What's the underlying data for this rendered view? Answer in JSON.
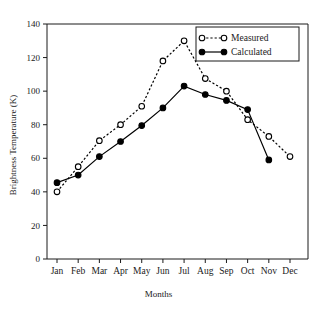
{
  "chart_data": {
    "type": "line",
    "title": "",
    "xlabel": "Months",
    "ylabel": "Brightness Temperature (K)",
    "categories": [
      "Jan",
      "Feb",
      "Mar",
      "Apr",
      "May",
      "Jun",
      "Jul",
      "Aug",
      "Sep",
      "Oct",
      "Nov",
      "Dec"
    ],
    "ylim": [
      0,
      140
    ],
    "yticks": [
      0,
      20,
      40,
      60,
      80,
      100,
      120,
      140
    ],
    "ytick_labels": [
      "0",
      "20",
      "40",
      "60",
      "80",
      "100",
      "120",
      "140"
    ],
    "grid": false,
    "legend_position": "top-right",
    "series": [
      {
        "name": "Measured",
        "marker": "open-circle",
        "linestyle": "dotted",
        "color": "#000000",
        "values": [
          40,
          55,
          70.5,
          80,
          91,
          118,
          130,
          107.5,
          100,
          83,
          73,
          61
        ]
      },
      {
        "name": "Calculated",
        "marker": "filled-circle",
        "linestyle": "solid",
        "color": "#000000",
        "values": [
          45.5,
          50,
          61,
          70,
          79.5,
          90,
          103,
          98,
          94.5,
          89,
          59,
          null
        ]
      }
    ]
  },
  "legend": {
    "entries": [
      {
        "label": "Measured"
      },
      {
        "label": "Calculated"
      }
    ]
  }
}
